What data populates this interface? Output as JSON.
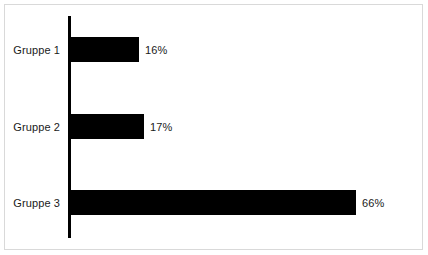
{
  "chart_data": {
    "type": "bar",
    "orientation": "horizontal",
    "title": "",
    "subtitle": "",
    "xlabel": "",
    "ylabel": "",
    "categories": [
      "Gruppe 1",
      "Gruppe 2",
      "Gruppe 3"
    ],
    "values": [
      16,
      17,
      66
    ],
    "value_labels": [
      "16%",
      "17%",
      "66%"
    ],
    "unit": "%",
    "xlim": [
      0,
      66
    ],
    "grid": false,
    "legend": null,
    "legend_position": "none",
    "annotations": [],
    "bars": [
      {
        "category": "Gruppe 1",
        "value": 16,
        "label": "16%"
      },
      {
        "category": "Gruppe 2",
        "value": 17,
        "label": "17%"
      },
      {
        "category": "Gruppe 3",
        "value": 66,
        "label": "66%"
      }
    ]
  },
  "style": {
    "bar_color": "#000000",
    "axis_color": "#000000",
    "text_color": "#1a1a1a",
    "frame_color": "#d9d9d9",
    "background_color": "#ffffff"
  }
}
